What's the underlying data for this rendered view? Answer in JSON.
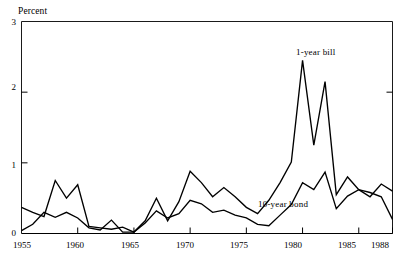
{
  "figure": {
    "background_color": "#ffffff",
    "line_color": "#000000",
    "axis_color": "#000000",
    "y_axis_unit_label": "Percent"
  },
  "axes": {
    "y_ticks": [
      "0",
      "1",
      "2",
      "3"
    ],
    "y_tick_values": [
      0,
      1,
      2,
      3
    ],
    "x_ticks": [
      "1955",
      "1960",
      "1965",
      "1970",
      "1975",
      "1980",
      "1985",
      "1988"
    ],
    "x_tick_values": [
      1955,
      1960,
      1965,
      1970,
      1975,
      1980,
      1985,
      1988
    ],
    "xlim": [
      1955,
      1988
    ],
    "ylim": [
      0,
      3
    ]
  },
  "annotations": {
    "bill_label": "1-year bill",
    "bond_label": "10-year bond"
  },
  "chart_data": {
    "type": "line",
    "title": "",
    "subtitle": "",
    "xlabel": "",
    "ylabel": "Percent",
    "xlim": [
      1955,
      1988
    ],
    "ylim": [
      0,
      3
    ],
    "grid": false,
    "legend_position": "inline-annotation",
    "x": [
      1955,
      1956,
      1957,
      1958,
      1959,
      1960,
      1961,
      1962,
      1963,
      1964,
      1965,
      1966,
      1967,
      1968,
      1969,
      1970,
      1971,
      1972,
      1973,
      1974,
      1975,
      1976,
      1977,
      1978,
      1979,
      1980,
      1981,
      1982,
      1983,
      1984,
      1985,
      1986,
      1987,
      1988
    ],
    "series": [
      {
        "name": "1-year bill",
        "values": [
          0.37,
          0.3,
          0.24,
          0.75,
          0.5,
          0.69,
          0.1,
          0.08,
          0.06,
          0.09,
          0.02,
          0.18,
          0.5,
          0.18,
          0.45,
          0.88,
          0.72,
          0.52,
          0.65,
          0.52,
          0.37,
          0.28,
          0.47,
          0.72,
          1.01,
          2.45,
          1.25,
          2.15,
          0.55,
          0.8,
          0.62,
          0.52,
          0.7,
          0.6
        ]
      },
      {
        "name": "10-year bond",
        "values": [
          0.04,
          0.13,
          0.3,
          0.23,
          0.3,
          0.22,
          0.08,
          0.05,
          0.19,
          0.02,
          0.02,
          0.15,
          0.32,
          0.22,
          0.28,
          0.47,
          0.42,
          0.3,
          0.33,
          0.26,
          0.22,
          0.13,
          0.11,
          0.26,
          0.41,
          0.72,
          0.62,
          0.87,
          0.35,
          0.53,
          0.62,
          0.58,
          0.52,
          0.2
        ]
      }
    ]
  }
}
